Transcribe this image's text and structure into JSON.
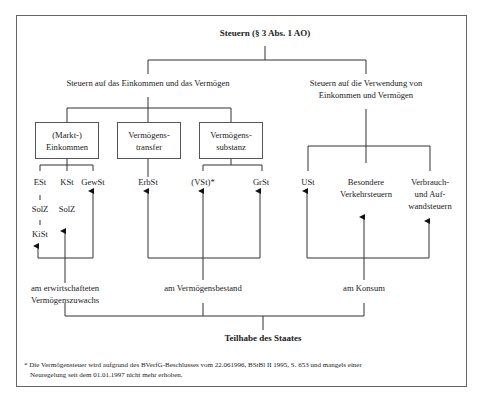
{
  "title": "Steuern (§ 3 Abs. 1 AO)",
  "branches": {
    "left": {
      "label": "Steuern auf das Einkommen und das Vermögen",
      "boxes": [
        {
          "line1": "(Markt-)",
          "line2": "Einkommen"
        },
        {
          "line1": "Vermögens-",
          "line2": "transfer"
        },
        {
          "line1": "Vermögens-",
          "line2": "substanz"
        }
      ],
      "taxes": {
        "est": "ESt",
        "kst": "KSt",
        "gewst": "GewSt",
        "solz1": "SolZ",
        "solz2": "SolZ",
        "kist": "KiSt",
        "erbst": "ErbSt",
        "vst": "(VSt)*",
        "grst": "GrSt"
      }
    },
    "right": {
      "label_line1": "Steuern auf die Verwendung von",
      "label_line2": "Einkommen und Vermögen",
      "taxes": {
        "ust": "USt",
        "verkehr_line1": "Besondere",
        "verkehr_line2": "Verkehrsteuern",
        "verbrauch_line1": "Verbrauch-",
        "verbrauch_line2": "und Auf-",
        "verbrauch_line3": "wandsteuern"
      }
    }
  },
  "bases": {
    "zuwachs_line1": "am erwirtschafteten",
    "zuwachs_line2": "Vermögenszuwachs",
    "bestand": "am Vermögensbestand",
    "konsum": "am Konsum"
  },
  "bottom_label": "Teilhabe des Staates",
  "footnote": {
    "line1": "* Die Vermögensteuer wird aufgrund des BVerfG-Beschlusses vom 22.061996, BStBl II 1995, S. 653 und mangels einer",
    "line2": "Neuregelung seit dem 01.01.1997 nicht mehr erhoben."
  }
}
